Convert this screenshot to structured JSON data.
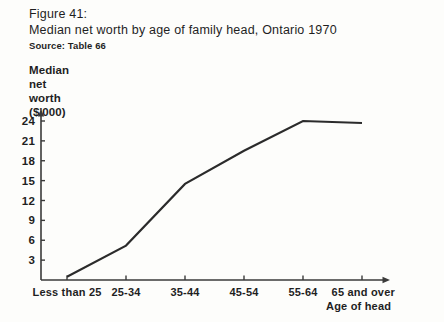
{
  "figure": {
    "number": "Figure 41:",
    "title": "Median net worth by age of family head, Ontario 1970",
    "source": "Source: Table 66"
  },
  "axis_label_lines": {
    "line1": "Median",
    "line2": "net",
    "line3": "worth",
    "line4": "($'000)"
  },
  "xaxis_title": "Age of head",
  "colors": {
    "line": "#2b2b2b",
    "axis": "#3a3a3a",
    "text": "#1f1f1f",
    "background": "#fdfdfb"
  },
  "chart_data": {
    "type": "line",
    "title": "Median net worth by age of family head, Ontario 1970",
    "xlabel": "Age of head",
    "ylabel": "Median net worth ($'000)",
    "categories": [
      "Less than 25",
      "25-34",
      "35-44",
      "45-54",
      "55-64",
      "65 and over"
    ],
    "values": [
      0.5,
      5.2,
      14.5,
      19.5,
      24.0,
      23.7
    ],
    "ylim": [
      0,
      25.5
    ],
    "yticks": [
      3,
      6,
      9,
      12,
      15,
      18,
      21,
      24
    ],
    "ytick_labels": [
      "3",
      "6",
      "9",
      "12",
      "15",
      "18",
      "21",
      "24"
    ],
    "grid": false,
    "legend": false,
    "marker": "none"
  }
}
